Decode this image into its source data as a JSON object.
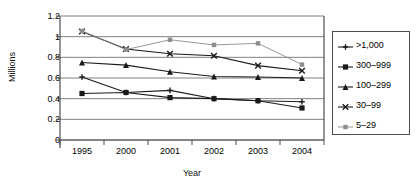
{
  "chart_data": {
    "type": "line",
    "title": "",
    "xlabel": "Year",
    "ylabel": "Millions",
    "categories": [
      "1995",
      "2000",
      "2001",
      "2002",
      "2003",
      "2004"
    ],
    "ylim": [
      0,
      1.2
    ],
    "yticks": [
      "0",
      "0.2",
      "0.4",
      "0.6",
      "0.8",
      "1",
      "1.2"
    ],
    "ytick_values": [
      0,
      0.2,
      0.4,
      0.6,
      0.8,
      1.0,
      1.2
    ],
    "grid": "horizontal",
    "legend_position": "right",
    "series": [
      {
        "name": ">1,000",
        "marker": "plus-cross",
        "values": [
          0.61,
          0.46,
          0.48,
          0.4,
          0.38,
          0.37
        ]
      },
      {
        "name": "300-999",
        "marker": "filled-square",
        "values": [
          0.45,
          0.46,
          0.41,
          0.4,
          0.38,
          0.31
        ]
      },
      {
        "name": "100-299",
        "marker": "filled-triangle",
        "values": [
          0.75,
          0.725,
          0.66,
          0.615,
          0.61,
          0.6
        ]
      },
      {
        "name": "30-99",
        "marker": "x-cross",
        "values": [
          1.05,
          0.88,
          0.835,
          0.815,
          0.72,
          0.67
        ]
      },
      {
        "name": "5-29",
        "marker": "small-square",
        "values": [
          1.055,
          0.875,
          0.97,
          0.92,
          0.935,
          0.73
        ]
      }
    ]
  },
  "legend": {
    "items": [
      {
        "label": ">1,000"
      },
      {
        "label": "300–999"
      },
      {
        "label": "100–299"
      },
      {
        "label": "30–99"
      },
      {
        "label": "5–29"
      }
    ]
  },
  "axes": {
    "y_title": "Millions",
    "x_title": "Year",
    "y_tick_labels": [
      "1.2",
      "1",
      "0.8",
      "0.6",
      "0.4",
      "0.2",
      "0"
    ],
    "x_tick_labels": [
      "1995",
      "2000",
      "2001",
      "2002",
      "2003",
      "2004"
    ]
  },
  "colors": {
    "series_dark": "#1a1a1a",
    "series_light": "#8c8c8c",
    "grid": "#808080",
    "frame": "#4d4d4d",
    "background": "#ffffff"
  }
}
